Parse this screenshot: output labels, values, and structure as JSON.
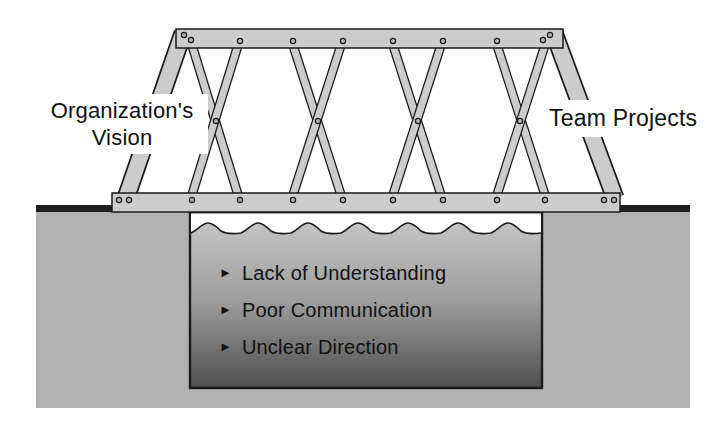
{
  "diagram": {
    "title_implicit": "Bridge from Organization's Vision to Team Projects over underwater issues"
  },
  "labels": {
    "left_line1": "Organization's",
    "left_line2": "Vision",
    "right": "Team Projects"
  },
  "pit": {
    "bullet_glyph": "►",
    "issues": [
      {
        "text": "Lack of Understanding"
      },
      {
        "text": "Poor Communication"
      },
      {
        "text": "Unclear Direction"
      }
    ]
  },
  "colors": {
    "page_bg": "#ffffff",
    "member": "#cccccc",
    "outline": "#1a1a1a",
    "ground": "#b1b1b1",
    "ground_band": "#1e1e1e",
    "water_top": "#c9c9c9",
    "water_mid": "#9e9e9e",
    "water_bottom": "#4e4e4e",
    "rivet": "#b3b3b3",
    "text": "#111111"
  }
}
